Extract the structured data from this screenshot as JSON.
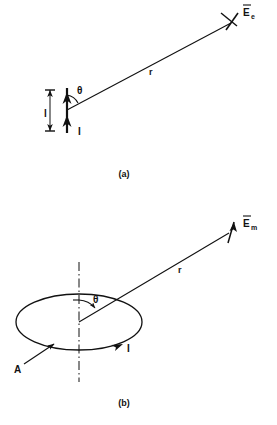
{
  "document": {
    "type": "technical-diagram",
    "description": "Radiation geometry for an electric (Hertzian) dipole and a magnetic (loop) dipole",
    "background_color": "#ffffff",
    "ink_color": "#111111"
  },
  "figures": [
    {
      "id": "figure-a",
      "caption": "(a)",
      "subject": "electric-dipole",
      "labels": {
        "field": "E",
        "field_subscript": "e",
        "field_overbar": true,
        "distance": "r",
        "angle": "θ",
        "current": "I",
        "length": "l"
      }
    },
    {
      "id": "figure-b",
      "caption": "(b)",
      "subject": "magnetic-loop-dipole",
      "labels": {
        "field": "E",
        "field_subscript": "m",
        "field_overbar": true,
        "distance": "r",
        "angle": "θ",
        "current": "I",
        "area": "A"
      }
    }
  ],
  "icons": {
    "arrow_current": "current-direction-arrow",
    "arrow_field": "field-vector-arrow",
    "dimension": "length-dimension-line",
    "axis": "dash-dot-axis-line",
    "arc": "angle-arc"
  }
}
